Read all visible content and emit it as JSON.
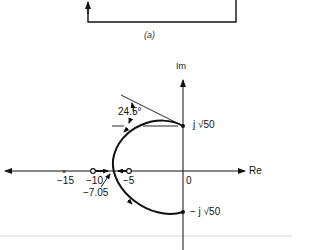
{
  "figure": {
    "caption_a": "(a)",
    "axes": {
      "imaginary_label": "Im",
      "real_label": "Re"
    },
    "real_axis_ticks": [
      {
        "label": "−15",
        "marker": "pole-x"
      },
      {
        "label": "−10",
        "marker": "zero-o"
      },
      {
        "label": "−5",
        "marker": "zero-o"
      },
      {
        "label": "0",
        "marker": "none"
      }
    ],
    "breakaway_point": "−7.05",
    "angle_annotation": "24.5°",
    "upper_crossing": "j √50",
    "lower_crossing": "− j √50",
    "upper_crossing_parts": {
      "prefix": "j",
      "radicand": "50"
    },
    "lower_crossing_parts": {
      "prefix": "− j",
      "radicand": "50"
    }
  }
}
